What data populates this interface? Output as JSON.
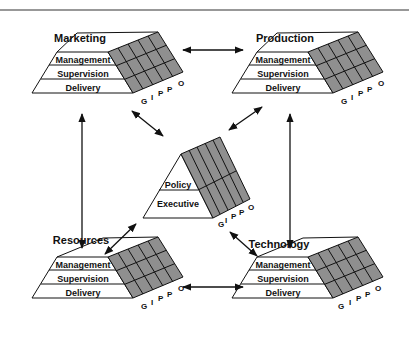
{
  "diagram": {
    "blocks": [
      {
        "id": "marketing",
        "title": "Marketing",
        "layers": [
          "Management",
          "Supervision",
          "Delivery"
        ],
        "axis": [
          "G",
          "I",
          "P",
          "P",
          "O"
        ]
      },
      {
        "id": "production",
        "title": "Production",
        "layers": [
          "Management",
          "Supervision",
          "Delivery"
        ],
        "axis": [
          "G",
          "I",
          "P",
          "P",
          "O"
        ]
      },
      {
        "id": "resources",
        "title": "Resources",
        "layers": [
          "Management",
          "Supervision",
          "Delivery"
        ],
        "axis": [
          "G",
          "I",
          "P",
          "P",
          "O"
        ]
      },
      {
        "id": "technology",
        "title": "Technology",
        "layers": [
          "Management",
          "Supervision",
          "Delivery"
        ],
        "axis": [
          "G",
          "I",
          "P",
          "P",
          "O"
        ]
      }
    ],
    "center": {
      "id": "executive-block",
      "layers": [
        "Policy",
        "Executive"
      ],
      "axis": [
        "G",
        "I",
        "P",
        "P",
        "O"
      ]
    },
    "connections": [
      [
        "marketing",
        "production"
      ],
      [
        "marketing",
        "resources"
      ],
      [
        "production",
        "technology"
      ],
      [
        "resources",
        "technology"
      ],
      [
        "marketing",
        "executive-block"
      ],
      [
        "production",
        "executive-block"
      ],
      [
        "resources",
        "executive-block"
      ],
      [
        "technology",
        "executive-block"
      ]
    ],
    "colors": {
      "grid_fill": "#8f8f8f",
      "line": "#111111",
      "background": "#ffffff"
    }
  }
}
